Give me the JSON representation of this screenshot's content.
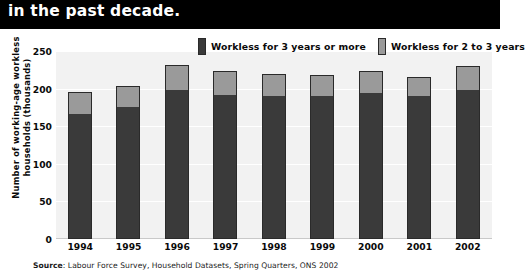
{
  "title": {
    "text": "in the past decade."
  },
  "legend": [
    {
      "label": "Workless for 3 years or more",
      "color": "#3a3a3a",
      "key": "three_plus"
    },
    {
      "label": "Workless for 2 to 3 years",
      "color": "#9a9a9a",
      "key": "two_to_three"
    }
  ],
  "source": {
    "prefix": "Source",
    "text": ": Labour Force Survey, Household Datasets, Spring Quarters, ONS 2002"
  },
  "chart_data": {
    "type": "bar",
    "stacked": true,
    "title": "in the past decade.",
    "xlabel": "",
    "ylabel": "Number of working-age workless households (thousands)",
    "ylim": [
      0,
      250
    ],
    "yticks": [
      0,
      50,
      100,
      150,
      200,
      250
    ],
    "grid": true,
    "legend_position": "top-right",
    "categories": [
      "1994",
      "1995",
      "1996",
      "1997",
      "1998",
      "1999",
      "2000",
      "2001",
      "2002"
    ],
    "series": [
      {
        "name": "Workless for 3 years or more",
        "color": "#3a3a3a",
        "values": [
          168,
          177,
          200,
          193,
          192,
          192,
          196,
          192,
          200
        ]
      },
      {
        "name": "Workless for 2 to 3 years",
        "color": "#9a9a9a",
        "values": [
          28,
          26,
          32,
          30,
          27,
          26,
          28,
          23,
          30
        ]
      }
    ],
    "totals": [
      196,
      203,
      232,
      223,
      219,
      218,
      224,
      215,
      230
    ]
  }
}
